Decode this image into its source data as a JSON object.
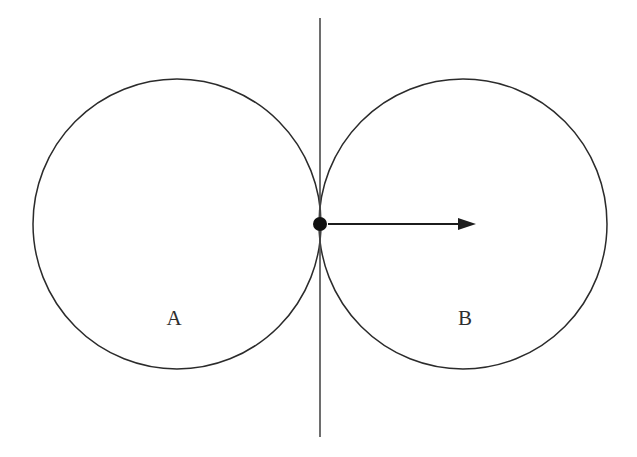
{
  "figure": {
    "background_color": "#ffffff",
    "stroke_color": "#2b2b2b",
    "width": 637,
    "height": 457
  },
  "chart_data": {
    "type": "diagram",
    "title": "",
    "xlabel": "",
    "ylabel": "",
    "background": "#ffffff",
    "tangent_point": {
      "x": 320,
      "y": 224,
      "radius": 7,
      "color": "#111111"
    },
    "circles": [
      {
        "label": "A",
        "cx": 177,
        "cy": 224,
        "rx": 144,
        "ry": 145,
        "stroke": "#2b2b2b",
        "stroke_width": 1.5,
        "fill": "none",
        "label_x": 174,
        "label_y": 320
      },
      {
        "label": "B",
        "cx": 463,
        "cy": 224,
        "rx": 144,
        "ry": 145,
        "stroke": "#2b2b2b",
        "stroke_width": 1.5,
        "fill": "none",
        "label_x": 465,
        "label_y": 320
      }
    ],
    "tangent_line": {
      "x": 320,
      "y_start": 18,
      "y_end": 437,
      "stroke": "#4a4a4a",
      "stroke_width": 1.6,
      "orientation": "vertical"
    },
    "arrow": {
      "x_start": 328,
      "x_end": 476,
      "y": 224,
      "direction": "right",
      "stroke": "#1c1c1c",
      "stroke_width": 2.1,
      "head_length": 18,
      "head_width": 12
    },
    "labels": [
      {
        "text": "A",
        "x": 174,
        "y": 320
      },
      {
        "text": "B",
        "x": 465,
        "y": 320
      }
    ]
  }
}
